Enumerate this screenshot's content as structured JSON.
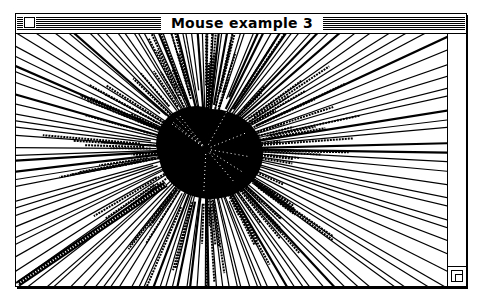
{
  "window": {
    "title": "Mouse example 3",
    "close_box": "close-box",
    "grow_box": "grow-box"
  },
  "canvas": {
    "description": "Starburst of lines radiating from a central point drawn by mouse tracking",
    "center": [
      190,
      115
    ],
    "dense_core_radius": 50,
    "line_color": "#000000",
    "background": "#ffffff"
  },
  "colors": {
    "frame": "#000000",
    "background": "#ffffff"
  }
}
